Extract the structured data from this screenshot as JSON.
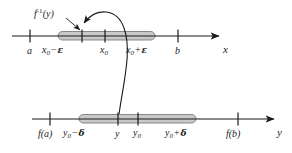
{
  "figure": {
    "kind": "math-diagram",
    "background_color": "#ffffff",
    "ink_color": "#1a1a1a",
    "band_fill_color": "#c9c9c9",
    "band_edge_color": "#6f6f6f"
  },
  "callout": {
    "label_f": "f",
    "label_exp": "-1",
    "label_arg": "(y)",
    "name": "f-inverse-of-y"
  },
  "x_axis": {
    "name": "x",
    "axis_label": "x",
    "ticks": [
      {
        "id": "a",
        "text_main": "a",
        "sub": "",
        "op": "",
        "tail": "",
        "x": 30
      },
      {
        "id": "x0-minus-e",
        "text_main": "x",
        "sub": "0",
        "op": "−",
        "tail": "ε",
        "x": 58
      },
      {
        "id": "arrow-tip",
        "text_main": "",
        "sub": "",
        "op": "",
        "tail": "",
        "x": 82
      },
      {
        "id": "x0",
        "text_main": "x",
        "sub": "0",
        "op": "",
        "tail": "",
        "x": 105
      },
      {
        "id": "x0-plus-e",
        "text_main": "x",
        "sub": "0",
        "op": "+",
        "tail": "ε",
        "x": 142
      },
      {
        "id": "b",
        "text_main": "b",
        "sub": "",
        "op": "",
        "tail": "",
        "x": 178
      }
    ],
    "band": {
      "start": 58,
      "end": 155
    }
  },
  "y_axis": {
    "name": "y",
    "axis_label": "y",
    "ticks": [
      {
        "id": "f-of-a",
        "text_main": "f(a)",
        "sub": "",
        "op": "",
        "tail": "",
        "x": 50
      },
      {
        "id": "y0-minus-d",
        "text_main": "y",
        "sub": "0",
        "op": "−",
        "tail": "δ",
        "x": 79
      },
      {
        "id": "y",
        "text_main": "y",
        "sub": "",
        "op": "",
        "tail": "",
        "x": 118
      },
      {
        "id": "y0",
        "text_main": "y",
        "sub": "0",
        "op": "",
        "tail": "",
        "x": 138
      },
      {
        "id": "y0-plus-d",
        "text_main": "y",
        "sub": "0",
        "op": "+",
        "tail": "δ",
        "x": 181
      },
      {
        "id": "f-of-b",
        "text_main": "f(b)",
        "sub": "",
        "op": "",
        "tail": "",
        "x": 238
      }
    ],
    "band": {
      "start": 79,
      "end": 196
    }
  },
  "labels": {
    "a": "a",
    "b": "b",
    "f_of_a": "f(a)",
    "f_of_b": "f(b)",
    "x_var": "x",
    "y_var": "y",
    "zero_sub": "0",
    "minus": "−",
    "plus": "+",
    "epsilon": "ε",
    "delta": "δ",
    "axis_x": "x",
    "axis_y": "y",
    "f_symbol": "f",
    "inverse_exp": "-1",
    "of_y": "(y)"
  }
}
